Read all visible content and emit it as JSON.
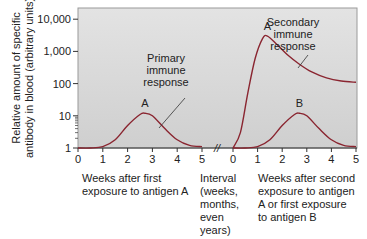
{
  "chart_data": {
    "type": "line",
    "title": "",
    "ylabel_lines": [
      "Relative amount of specific",
      "antibody in blood (arbitrary units)"
    ],
    "yscale": "log",
    "ylim": [
      1,
      20000
    ],
    "yticks": [
      {
        "value": 1,
        "label": "1"
      },
      {
        "value": 10,
        "label": "10"
      },
      {
        "value": 100,
        "label": "100"
      },
      {
        "value": 1000,
        "label": "1,000"
      },
      {
        "value": 10000,
        "label": "10,000"
      }
    ],
    "panels": [
      {
        "name": "first-exposure",
        "xlim": [
          0,
          5
        ],
        "xticks": [
          "0",
          "1",
          "2",
          "3",
          "4",
          "5"
        ],
        "xlabel_lines": [
          "Weeks after first",
          "exposure to antigen A"
        ]
      },
      {
        "name": "interval",
        "xlabel_lines": [
          "Interval",
          "(weeks,",
          "months,",
          "even",
          "years)"
        ],
        "break_mark": "//"
      },
      {
        "name": "second-exposure",
        "xlim": [
          0,
          5
        ],
        "xticks": [
          "0",
          "1",
          "2",
          "3",
          "4",
          "5"
        ],
        "xlabel_lines": [
          "Weeks after second",
          "exposure to antigen",
          "A or first exposure",
          "to antigen B"
        ]
      }
    ],
    "series": [
      {
        "name": "Primary response to A",
        "panel": "first-exposure",
        "peak_label": "A",
        "x": [
          0,
          0.5,
          1,
          1.5,
          2,
          2.5,
          2.7,
          3,
          3.5,
          4,
          4.5,
          5
        ],
        "y": [
          1,
          1,
          1.1,
          1.8,
          5,
          11,
          12,
          10,
          4,
          1.8,
          1.2,
          1.1
        ]
      },
      {
        "name": "Secondary response to A",
        "panel": "second-exposure",
        "peak_label": "A",
        "x": [
          0,
          0.3,
          0.6,
          0.9,
          1.2,
          1.4,
          1.8,
          2.2,
          2.7,
          3.2,
          3.8,
          4.4,
          5
        ],
        "y": [
          1,
          3,
          50,
          600,
          2500,
          3000,
          1600,
          800,
          400,
          230,
          150,
          120,
          110
        ]
      },
      {
        "name": "Primary response to B",
        "panel": "second-exposure",
        "peak_label": "B",
        "x": [
          0,
          0.5,
          1,
          1.5,
          2,
          2.5,
          2.7,
          3,
          3.5,
          4,
          4.5,
          5
        ],
        "y": [
          1,
          1,
          1.1,
          1.8,
          5,
          11,
          12,
          10,
          4,
          1.8,
          1.2,
          1.1
        ]
      }
    ],
    "annotations": [
      {
        "text_lines": [
          "Primary",
          "immune",
          "response"
        ],
        "points_to": "Primary response to A"
      },
      {
        "text_lines": [
          "Secondary",
          "immune",
          "response"
        ],
        "points_to": "Secondary response to A"
      }
    ],
    "colors": {
      "curve": "#8a2530",
      "plot_bg_top": "#e3e3e3",
      "plot_bg_bottom": "#cfcfcf",
      "frame": "#9a9a9a",
      "axis": "#333333"
    }
  }
}
